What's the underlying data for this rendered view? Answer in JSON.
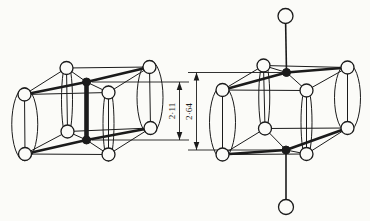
{
  "colors": {
    "ink": "#1b1b1b",
    "paper": "#fbfbf8"
  },
  "figure": {
    "width": 370,
    "height": 221,
    "structures": [
      {
        "id": "left-unit-cell",
        "thin_lines": [
          [
            66.5,
            68,
            149.5,
            67
          ],
          [
            24.5,
            94.5,
            108.5,
            92.5
          ],
          [
            24.5,
            94.5,
            66.5,
            68
          ],
          [
            108.5,
            92.5,
            149.5,
            67
          ],
          [
            67.5,
            131.5,
            150.5,
            128
          ],
          [
            25,
            154,
            108.5,
            154.5
          ],
          [
            25,
            154,
            67.5,
            131.5
          ],
          [
            108.5,
            154.5,
            150.5,
            128
          ],
          [
            66.5,
            68,
            67.5,
            131.5
          ],
          [
            149.5,
            67,
            150.5,
            128
          ],
          [
            24.5,
            94.5,
            25,
            154
          ],
          [
            108.5,
            92.5,
            108.5,
            154.5
          ],
          [
            66.5,
            68,
            86.5,
            82
          ],
          [
            86.5,
            82,
            108.5,
            92.5
          ],
          [
            67.5,
            131.5,
            86.5,
            140
          ],
          [
            86.5,
            140,
            108.5,
            154.5
          ]
        ],
        "medium_lines": [],
        "thick_lines": [
          [
            24.5,
            94.5,
            86.5,
            82
          ],
          [
            86.5,
            82,
            149.5,
            67
          ],
          [
            25,
            154,
            86.5,
            140
          ],
          [
            86.5,
            140,
            150.5,
            128
          ]
        ],
        "heavy_lines": [
          [
            86.5,
            82,
            86.5,
            140
          ]
        ],
        "ellipses": [
          [
            24.75,
            124.25,
            13,
            36.5
          ],
          [
            150,
            97.5,
            13,
            37
          ],
          [
            67,
            99.75,
            5.5,
            38
          ],
          [
            108.5,
            123.5,
            5.5,
            37.5
          ]
        ],
        "open_atoms": [
          [
            24.5,
            94.5,
            6.5
          ],
          [
            108.5,
            92.5,
            6.5
          ],
          [
            66.5,
            68,
            6.5
          ],
          [
            149.5,
            67,
            6.5
          ],
          [
            25,
            154,
            6.5
          ],
          [
            108.5,
            154.5,
            6.5
          ],
          [
            67.5,
            131.5,
            6.5
          ],
          [
            150.5,
            128,
            6.5
          ]
        ],
        "filled_atoms": [
          [
            86.5,
            82,
            4
          ],
          [
            86.5,
            140,
            4
          ]
        ]
      },
      {
        "id": "right-unit-cell",
        "thin_lines": [
          [
            263.5,
            65.5,
            347.5,
            67.5
          ],
          [
            222.5,
            90,
            306.5,
            90.5
          ],
          [
            222.5,
            90,
            263.5,
            65.5
          ],
          [
            306.5,
            90.5,
            347.5,
            67.5
          ],
          [
            265,
            128.5,
            347.5,
            128
          ],
          [
            222.5,
            154.5,
            306.5,
            154
          ],
          [
            222.5,
            154.5,
            265,
            128.5
          ],
          [
            306.5,
            154,
            347.5,
            128
          ],
          [
            263.5,
            65.5,
            265,
            128.5
          ],
          [
            347.5,
            67.5,
            347.5,
            128
          ],
          [
            222.5,
            90,
            222.5,
            154.5
          ],
          [
            306.5,
            90.5,
            306.5,
            154
          ],
          [
            263.5,
            65.5,
            286.5,
            72.5
          ],
          [
            286.5,
            72.5,
            306.5,
            90.5
          ],
          [
            265,
            128.5,
            286,
            150
          ],
          [
            286,
            150,
            306.5,
            154
          ]
        ],
        "medium_lines": [
          [
            285.5,
            16,
            286.5,
            72.5
          ],
          [
            286,
            150,
            286,
            207
          ]
        ],
        "thick_lines": [
          [
            222.5,
            90,
            286.5,
            72.5
          ],
          [
            286.5,
            72.5,
            347.5,
            67.5
          ],
          [
            222.5,
            154.5,
            286,
            150
          ],
          [
            286,
            150,
            347.5,
            128
          ]
        ],
        "heavy_lines": [],
        "ellipses": [
          [
            222.5,
            122.25,
            13,
            36.5
          ],
          [
            347.5,
            97.75,
            13,
            34.5
          ],
          [
            264.25,
            97,
            5.5,
            36
          ],
          [
            306.5,
            122.25,
            5.5,
            36.5
          ]
        ],
        "open_atoms": [
          [
            222.5,
            90,
            6.5
          ],
          [
            306.5,
            90.5,
            6.5
          ],
          [
            263.5,
            65.5,
            6.5
          ],
          [
            347.5,
            67.5,
            6.5
          ],
          [
            222.5,
            154.5,
            6.5
          ],
          [
            306.5,
            154,
            6.5
          ],
          [
            265,
            128.5,
            6.5
          ],
          [
            347.5,
            128,
            6.5
          ],
          [
            285.5,
            16,
            7.5
          ],
          [
            286,
            207,
            7.5
          ]
        ],
        "filled_atoms": [
          [
            286.5,
            72.5,
            4
          ],
          [
            286,
            150,
            4
          ]
        ]
      }
    ],
    "dimensions": [
      {
        "id": "dimension-2-11",
        "label": "2·11",
        "line_x": 179.5,
        "y1": 82,
        "y2": 140,
        "extensions": [
          [
            92,
            82,
            189
          ],
          [
            92,
            140,
            189
          ]
        ],
        "label_pos": [
          172.5,
          111
        ]
      },
      {
        "id": "dimension-2-64",
        "label": "2·64",
        "line_x": 196.5,
        "y1": 72.5,
        "y2": 150,
        "extensions": [
          [
            188,
            72.5,
            282
          ],
          [
            188,
            150,
            282
          ]
        ],
        "label_pos": [
          189.5,
          111.5
        ]
      }
    ]
  }
}
